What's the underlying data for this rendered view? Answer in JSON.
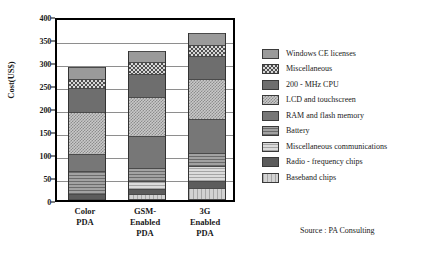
{
  "chart_data": {
    "type": "bar",
    "subtype": "stacked-vertical",
    "title": "",
    "xlabel": "",
    "ylabel": "Cost(US$)",
    "ylim": [
      0,
      400
    ],
    "yticks": [
      0,
      50,
      100,
      150,
      200,
      250,
      300,
      350,
      400
    ],
    "ytick_labels": [
      "0",
      "50",
      "100",
      "150",
      "200",
      "250",
      "300",
      "350",
      "400"
    ],
    "grid": true,
    "grid_axis": "y",
    "legend_position": "right",
    "categories": [
      "Color PDA",
      "GSM-Enabled PDA",
      "3G Enabled PDA"
    ],
    "category_label_lines": [
      [
        "Color",
        "PDA"
      ],
      [
        "GSM-",
        "Enabled",
        "PDA"
      ],
      [
        "3G",
        "Enabled",
        "PDA"
      ]
    ],
    "stack_order_bottom_to_top": [
      "Baseband  chips",
      "Radio - frequency chips",
      "Miscellaneous communications",
      "Battery",
      "RAM and flash memory",
      "LCD and  touchscreen",
      "200 - MHz CPU",
      "Miscellaneous",
      "Windows CE licenses"
    ],
    "series": [
      {
        "name": "Baseband  chips",
        "key": "baseband",
        "pattern": "p-baseband",
        "color": "#bdbdbd",
        "values": [
          0,
          14,
          27
        ]
      },
      {
        "name": "Radio - frequency chips",
        "key": "radio",
        "pattern": "p-radio",
        "color": "#5c5c5c",
        "values": [
          14,
          10,
          14
        ]
      },
      {
        "name": "Miscellaneous communications",
        "key": "misccom",
        "pattern": "p-misccom",
        "color": "#c4c4c4",
        "values": [
          0,
          18,
          32
        ]
      },
      {
        "name": "Battery",
        "key": "battery",
        "pattern": "p-battery",
        "color": "#8b8b8b",
        "values": [
          50,
          28,
          29
        ]
      },
      {
        "name": "RAM and flash memory",
        "key": "ram",
        "pattern": "p-ram",
        "color": "#777777",
        "values": [
          37,
          70,
          75
        ]
      },
      {
        "name": "LCD and  touchscreen",
        "key": "lcd",
        "pattern": "p-lcd",
        "color": "#c9c9c9",
        "values": [
          90,
          85,
          87
        ]
      },
      {
        "name": "200 - MHz CPU",
        "key": "cpu",
        "pattern": "p-cpu",
        "color": "#6e6e6e",
        "values": [
          52,
          50,
          50
        ]
      },
      {
        "name": "Miscellaneous",
        "key": "misc",
        "pattern": "p-misc",
        "color": "#4f4f4f",
        "values": [
          21,
          25,
          24
        ]
      },
      {
        "name": "Windows CE licenses",
        "key": "wince",
        "pattern": "p-wince",
        "color": "#9a9a9a",
        "values": [
          25,
          25,
          25
        ]
      }
    ],
    "totals": [
      289,
      325,
      363
    ]
  },
  "legend": {
    "items": [
      {
        "label": "Windows CE licenses",
        "pattern": "p-wince"
      },
      {
        "label": "Miscellaneous",
        "pattern": "p-misc"
      },
      {
        "label": "200 - MHz CPU",
        "pattern": "p-cpu"
      },
      {
        "label": "LCD and  touchscreen",
        "pattern": "p-lcd"
      },
      {
        "label": "RAM and flash memory",
        "pattern": "p-ram"
      },
      {
        "label": "Battery",
        "pattern": "p-battery"
      },
      {
        "label": "Miscellaneous communications",
        "pattern": "p-misccom"
      },
      {
        "label": "Radio - frequency chips",
        "pattern": "p-radio"
      },
      {
        "label": "Baseband  chips",
        "pattern": "p-baseband"
      }
    ]
  },
  "source": {
    "text": "Source : PA Consulting"
  },
  "colors": {
    "axis": "#000000",
    "grid": "#8e8e8e",
    "background": "#ffffff",
    "text": "#1a1a1a"
  }
}
